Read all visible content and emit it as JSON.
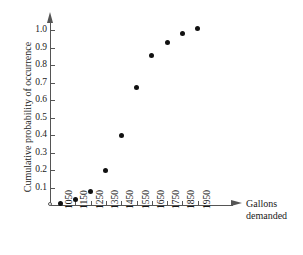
{
  "chart_data": {
    "type": "scatter",
    "title": "",
    "subtitle": "",
    "xlabel_lines": [
      "Gallons",
      "demanded"
    ],
    "xlabel": "Gallons demanded",
    "ylabel": "Cumulative probability of occurrence",
    "x": [
      1050,
      1150,
      1250,
      1350,
      1450,
      1550,
      1650,
      1750,
      1850,
      1950
    ],
    "values": [
      0.01,
      0.03,
      0.08,
      0.2,
      0.4,
      0.67,
      0.855,
      0.93,
      0.98,
      1.01
    ],
    "series": [
      {
        "name": "Cumulative probability of occurrence",
        "values": [
          0.01,
          0.03,
          0.08,
          0.2,
          0.4,
          0.67,
          0.855,
          0.93,
          0.98,
          1.01
        ]
      }
    ],
    "xtick_labels": [
      "1050",
      "1150",
      "1250",
      "1350",
      "1450",
      "1550",
      "1650",
      "1750",
      "1850",
      "1950"
    ],
    "ytick_labels": [
      "0.1",
      "0.2",
      "0.3",
      "0.4",
      "0.5",
      "0.6",
      "0.7",
      "0.8",
      "0.9",
      "1.0"
    ],
    "ytick_values": [
      0.1,
      0.2,
      0.3,
      0.4,
      0.5,
      0.6,
      0.7,
      0.8,
      0.9,
      1.0
    ],
    "xlim": [
      1000,
      2000
    ],
    "ylim": [
      0,
      1.0
    ],
    "grid": false,
    "legend": false,
    "legend_position": "none",
    "origin_label": "",
    "marker": "filled-circle",
    "marker_color": "#111111",
    "axis_color": "#555555",
    "background_color": "#ffffff"
  }
}
